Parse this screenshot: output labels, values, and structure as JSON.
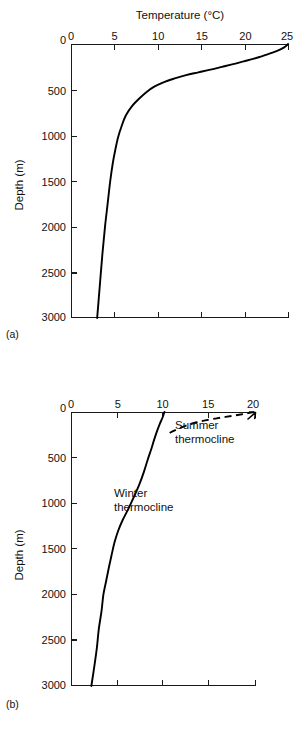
{
  "figure": {
    "panel_a_label": "(a)",
    "panel_b_label": "(b)"
  },
  "chart_data": [
    {
      "id": "panel-a",
      "type": "line",
      "title": "Temperature (°C)",
      "xlabel": "Temperature (°C)",
      "ylabel": "Depth (m)",
      "xlim": [
        0,
        25
      ],
      "ylim": [
        3000,
        0
      ],
      "x_axis_position": "top",
      "y_axis_inverted": true,
      "grid": false,
      "legend": "none",
      "xticks": [
        0,
        5,
        10,
        15,
        20,
        25
      ],
      "xtick_labels": [
        "0",
        "5",
        "10",
        "15",
        "20",
        "25"
      ],
      "yticks": [
        0,
        500,
        1000,
        1500,
        2000,
        2500,
        3000
      ],
      "ytick_labels": [
        "0",
        "500",
        "1000",
        "1500",
        "2000",
        "2500",
        "3000"
      ],
      "series": [
        {
          "name": "Low-latitude temperature profile",
          "style": "solid",
          "x": [
            24.9,
            24.4,
            23.5,
            22.3,
            21.0,
            19.8,
            18.6,
            17.3,
            16.0,
            14.6,
            13.2,
            11.8,
            10.6,
            9.5,
            8.6,
            7.8,
            7.0,
            6.3,
            5.8,
            5.4,
            5.1,
            4.8,
            4.5,
            4.2,
            3.9,
            3.6,
            3.3,
            3.0
          ],
          "y": [
            0,
            40,
            80,
            120,
            160,
            190,
            220,
            250,
            280,
            310,
            340,
            380,
            420,
            470,
            530,
            600,
            680,
            780,
            900,
            1020,
            1150,
            1300,
            1500,
            1750,
            2000,
            2300,
            2650,
            3000
          ]
        }
      ]
    },
    {
      "id": "panel-b",
      "type": "line",
      "title": "",
      "xlabel": "",
      "ylabel": "Depth (m)",
      "xlim": [
        0,
        20
      ],
      "ylim": [
        3000,
        0
      ],
      "x_axis_position": "top",
      "y_axis_inverted": true,
      "grid": false,
      "legend": "inline-annotations",
      "xticks": [
        0,
        5,
        10,
        15,
        20
      ],
      "xtick_labels": [
        "0",
        "5",
        "10",
        "15",
        "20"
      ],
      "yticks": [
        0,
        500,
        1000,
        1500,
        2000,
        2500,
        3000
      ],
      "ytick_labels": [
        "0",
        "500",
        "1000",
        "1500",
        "2000",
        "2500",
        "3000"
      ],
      "series": [
        {
          "name": "Winter thermocline",
          "style": "solid",
          "label": "Winter\nthermocline",
          "x": [
            10.1,
            9.9,
            9.6,
            9.3,
            9.0,
            8.7,
            8.3,
            7.9,
            7.4,
            6.8,
            6.2,
            5.6,
            5.1,
            4.7,
            4.4,
            4.1,
            3.8,
            3.5,
            3.3,
            3.0,
            2.8,
            2.5,
            2.2
          ],
          "y": [
            0,
            60,
            130,
            210,
            300,
            400,
            520,
            650,
            790,
            930,
            1060,
            1180,
            1300,
            1430,
            1560,
            1700,
            1850,
            2000,
            2180,
            2380,
            2580,
            2800,
            3000
          ]
        },
        {
          "name": "Summer thermocline",
          "style": "dashed",
          "label": "Summer\nthermocline",
          "x": [
            19.8,
            18.9,
            17.8,
            16.7,
            15.6,
            14.5,
            13.6,
            12.8,
            12.1,
            11.4,
            10.8,
            10.3
          ],
          "y": [
            0,
            18,
            36,
            54,
            72,
            92,
            112,
            136,
            162,
            192,
            222,
            255
          ]
        }
      ],
      "annotations": [
        {
          "text_line1": "Summer",
          "text_line2": "thermocline"
        },
        {
          "text_line1": "Winter",
          "text_line2": "thermocline"
        }
      ]
    }
  ],
  "labels": {
    "temperature_axis_title": "Temperature (°C)",
    "depth_axis_title": "Depth (m)",
    "summer_line1": "Summer",
    "summer_line2": "thermocline",
    "winter_line1": "Winter",
    "winter_line2": "thermocline"
  },
  "colors": {
    "ink": "#111111",
    "curve": "#000000",
    "background": "#ffffff"
  }
}
